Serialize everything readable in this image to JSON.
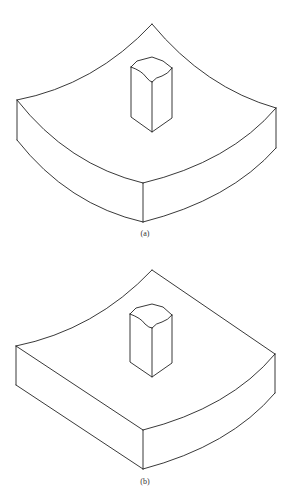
{
  "figure": {
    "panels": [
      {
        "id": "a",
        "label": "(a)",
        "description": "Block with concave curved top edges on all four sides and a central prismatic post"
      },
      {
        "id": "b",
        "label": "(b)",
        "description": "Block with two straight edges and two concave curved edges, central prismatic post"
      }
    ],
    "stroke_color": "#222222",
    "background": "#ffffff"
  }
}
